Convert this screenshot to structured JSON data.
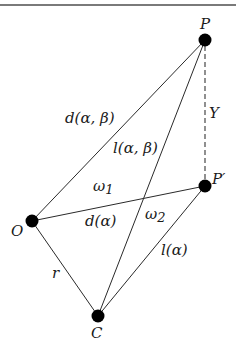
{
  "diagram": {
    "type": "geometric-figure",
    "nodes": [
      {
        "id": "P",
        "label": "P",
        "x": 205,
        "y": 40
      },
      {
        "id": "P_prime",
        "label": "P′",
        "x": 205,
        "y": 186
      },
      {
        "id": "O",
        "label": "O",
        "x": 32,
        "y": 221
      },
      {
        "id": "C",
        "label": "C",
        "x": 98,
        "y": 316
      }
    ],
    "edges": [
      {
        "from": "O",
        "to": "P",
        "label": "d(α, β)",
        "style": "solid"
      },
      {
        "from": "C",
        "to": "P",
        "label": "l(α, β)",
        "style": "solid"
      },
      {
        "from": "O",
        "to": "P_prime",
        "label": "d(α)",
        "style": "solid"
      },
      {
        "from": "C",
        "to": "P_prime",
        "label": "l(α)",
        "style": "solid"
      },
      {
        "from": "O",
        "to": "C",
        "label": "r",
        "style": "solid"
      },
      {
        "from": "P",
        "to": "P_prime",
        "label": "Y",
        "style": "dashed"
      }
    ],
    "angle_labels": [
      {
        "label": "ω",
        "sub": "1"
      },
      {
        "label": "ω",
        "sub": "2"
      }
    ],
    "labels": {
      "P": "P",
      "P_prime": "P′",
      "O": "O",
      "C": "C",
      "d_alpha_beta": "d(α, β)",
      "l_alpha_beta": "l(α, β)",
      "d_alpha": "d(α)",
      "l_alpha": "l(α)",
      "r": "r",
      "Y": "Y",
      "omega": "ω",
      "omega1_sub": "1",
      "omega2_sub": "2"
    },
    "colors": {
      "node": "#000000",
      "edge": "#2a2a2a",
      "dashed": "#555555",
      "topline": "#7a7a7a"
    }
  }
}
